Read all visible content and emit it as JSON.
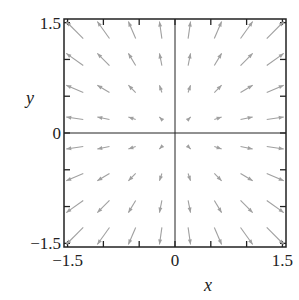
{
  "chart_data": {
    "type": "quiver",
    "title": "",
    "xlabel": "x",
    "ylabel": "y",
    "xlim": [
      -1.55,
      1.55
    ],
    "ylim": [
      -1.55,
      1.55
    ],
    "xticks": [
      -1.5,
      -1.0,
      -0.5,
      0,
      0.5,
      1.0,
      1.5
    ],
    "yticks": [
      -1.5,
      -1.0,
      -0.5,
      0,
      0.5,
      1.0,
      1.5
    ],
    "xtick_labels": [
      {
        "value": -1.5,
        "label": "−1.5"
      },
      {
        "value": 0,
        "label": "0"
      },
      {
        "value": 1.5,
        "label": "1.5"
      }
    ],
    "ytick_labels": [
      {
        "value": 1.5,
        "label": "1.5"
      },
      {
        "value": 0,
        "label": "0"
      },
      {
        "value": -1.5,
        "label": "−1.5"
      }
    ],
    "grid_points_x": [
      -1.4,
      -1.0,
      -0.6,
      -0.2,
      0.2,
      0.6,
      1.0,
      1.4
    ],
    "grid_points_y": [
      -1.4,
      -1.0,
      -0.6,
      -0.2,
      0.2,
      0.6,
      1.0,
      1.4
    ],
    "vector_field": "radial outward: (u, v) = (x, y)",
    "zero_lines": true,
    "grid": false,
    "arrow_color": "#a0a0a0",
    "axis_color": "#222222"
  }
}
